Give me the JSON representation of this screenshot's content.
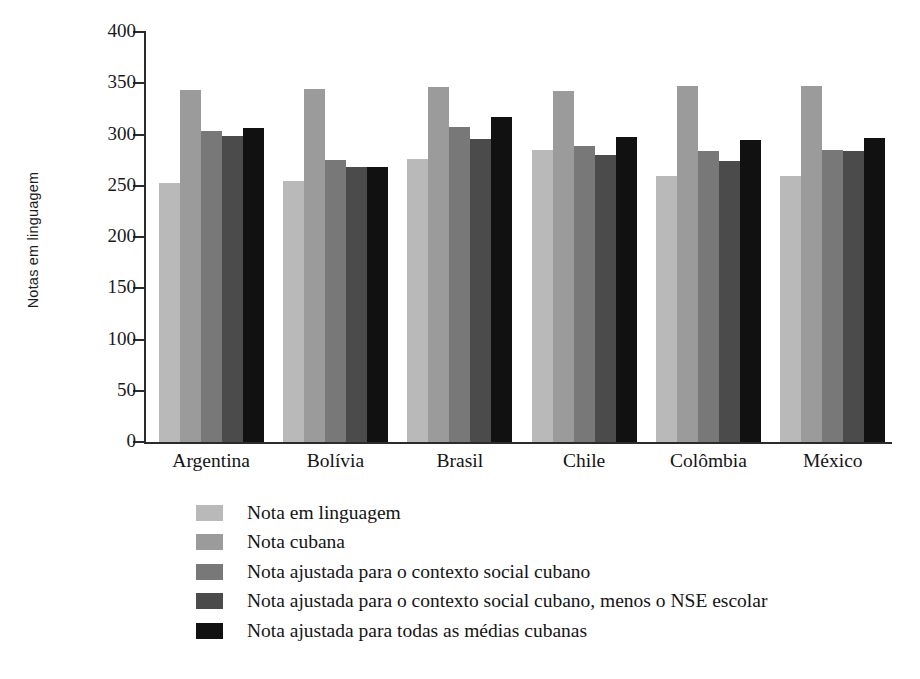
{
  "chart_data": {
    "type": "bar",
    "title": "",
    "xlabel": "",
    "ylabel": "Notas em linguagem",
    "ylim": [
      0,
      400
    ],
    "yticks": [
      0,
      50,
      100,
      150,
      200,
      250,
      300,
      350,
      400
    ],
    "grid": false,
    "legend_position": "bottom-left",
    "categories": [
      "Argentina",
      "Bolívia",
      "Brasil",
      "Chile",
      "Colômbia",
      "México"
    ],
    "series": [
      {
        "name": "Nota em linguagem",
        "color": "#b9b9b9",
        "values": [
          253,
          255,
          276,
          285,
          260,
          260
        ]
      },
      {
        "name": "Nota cubana",
        "color": "#9b9b9b",
        "values": [
          343,
          344,
          346,
          342,
          347,
          347
        ]
      },
      {
        "name": "Nota ajustada para o contexto social cubano",
        "color": "#787878",
        "values": [
          303,
          275,
          307,
          289,
          284,
          285
        ]
      },
      {
        "name": "Nota ajustada para o contexto social cubano, menos o NSE escolar",
        "color": "#4b4b4b",
        "values": [
          299,
          268,
          296,
          280,
          274,
          284
        ]
      },
      {
        "name": "Nota ajustada para todas as médias cubanas",
        "color": "#111111",
        "values": [
          306,
          268,
          317,
          298,
          295,
          297
        ]
      }
    ]
  },
  "axis": {
    "y_title": "Notas em linguagem",
    "tick_labels": [
      "400",
      "350",
      "300",
      "250",
      "200",
      "150",
      "100",
      "50",
      "0"
    ]
  },
  "legend": {
    "items": [
      {
        "label": "Nota em linguagem",
        "color": "#b9b9b9"
      },
      {
        "label": "Nota cubana",
        "color": "#9b9b9b"
      },
      {
        "label": "Nota ajustada para o contexto social cubano",
        "color": "#787878"
      },
      {
        "label": "Nota ajustada para o contexto social cubano, menos o NSE escolar",
        "color": "#4b4b4b"
      },
      {
        "label": "Nota ajustada para todas as médias cubanas",
        "color": "#111111"
      }
    ]
  }
}
